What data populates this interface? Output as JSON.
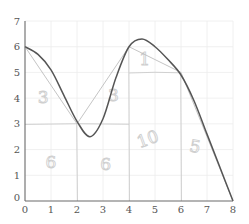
{
  "chart_data": {
    "type": "line",
    "title": "",
    "xlabel": "",
    "ylabel": "",
    "xlim": [
      0,
      8
    ],
    "ylim": [
      0,
      7
    ],
    "grid": true,
    "x_ticks": [
      "0",
      "1",
      "2",
      "3",
      "4",
      "5",
      "6",
      "7",
      "8"
    ],
    "y_ticks": [
      "0",
      "1",
      "2",
      "3",
      "4",
      "5",
      "6",
      "7"
    ],
    "series": [
      {
        "name": "curve",
        "style": "smooth dark",
        "x": [
          0,
          0.5,
          1,
          1.5,
          2,
          2.5,
          3,
          3.5,
          4,
          4.5,
          5,
          5.5,
          6,
          6.5,
          7,
          7.5,
          8
        ],
        "values": [
          6,
          5.7,
          5.1,
          4.1,
          3.1,
          2.5,
          3.2,
          4.8,
          6.0,
          6.3,
          6.0,
          5.5,
          4.9,
          3.9,
          2.6,
          1.3,
          0
        ]
      },
      {
        "name": "trapezoid approximation",
        "style": "light piecewise linear",
        "x": [
          0,
          2,
          4,
          6,
          8
        ],
        "values": [
          6,
          3,
          6,
          5,
          0
        ]
      }
    ],
    "annotations": [
      {
        "text": "3",
        "x": 0.7,
        "y": 3.8,
        "note": "handwritten area of top region 0-2"
      },
      {
        "text": "3",
        "x": 3.4,
        "y": 3.9,
        "note": "handwritten area of top region 2-4"
      },
      {
        "text": "1",
        "x": 4.6,
        "y": 5.3,
        "note": "handwritten area of triangle 4-6"
      },
      {
        "text": "6",
        "x": 1.0,
        "y": 1.3,
        "note": "handwritten area 0-2 rectangle"
      },
      {
        "text": "6",
        "x": 3.1,
        "y": 1.2,
        "note": "handwritten area 2-4 rectangle"
      },
      {
        "text": "10",
        "x": 4.8,
        "y": 2.2,
        "note": "handwritten area 4-6 rectangle"
      },
      {
        "text": "5",
        "x": 6.5,
        "y": 1.9,
        "note": "handwritten area of triangle 6-8"
      }
    ],
    "dividers": {
      "horizontal": [
        {
          "y": 3,
          "x_from": 0,
          "x_to": 4
        },
        {
          "y": 5,
          "x_from": 4,
          "x_to": 6
        }
      ],
      "vertical": [
        2,
        4,
        6
      ]
    }
  }
}
